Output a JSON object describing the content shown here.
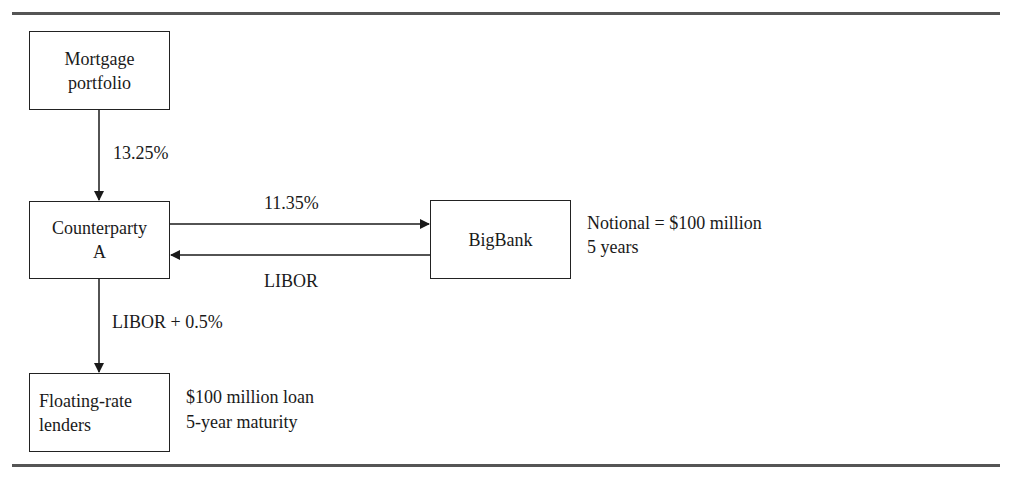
{
  "diagram": {
    "nodes": {
      "mortgage": {
        "line1": "Mortgage",
        "line2": "portfolio"
      },
      "counterparty": {
        "line1": "Counterparty",
        "line2": "A"
      },
      "bigbank": {
        "label": "BigBank"
      },
      "floating": {
        "line1": "Floating-rate",
        "line2": "lenders"
      }
    },
    "edges": {
      "mortgage_to_counterparty": "13.25%",
      "counterparty_to_bigbank": "11.35%",
      "bigbank_to_counterparty": "LIBOR",
      "counterparty_to_floating": "LIBOR + 0.5%"
    },
    "notes": {
      "swap": {
        "line1": "Notional = $100 million",
        "line2": "5 years"
      },
      "loan": {
        "line1": "$100 million loan",
        "line2": "5-year maturity"
      }
    }
  }
}
